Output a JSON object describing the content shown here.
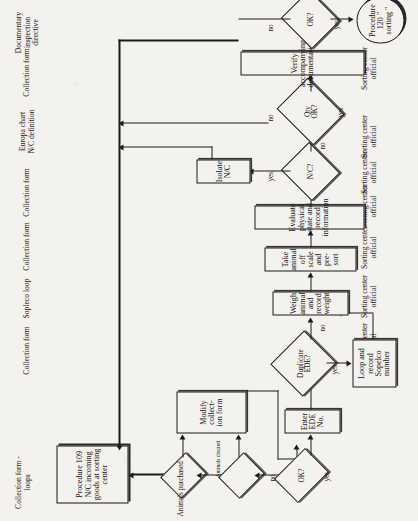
{
  "document": {
    "title": "Procedure 109 - N/C incoming goods at sorting center flowchart",
    "orientation": "rotated-90-ccw",
    "page_background": "#f4f2ee",
    "ink_color": "#141414"
  },
  "start_terminal": {
    "label": "Procedure 109\nN/C incoming\ngoods at sorting\ncenter"
  },
  "end_terminal": {
    "label": "Procedure 120 \" sorting \""
  },
  "process_nodes": [
    {
      "id": "modify-collection-form",
      "label": "Modify collect-\nion form"
    },
    {
      "id": "enter-ede-no",
      "label": "Enter EDE No."
    },
    {
      "id": "loop-record-sopelco",
      "label": "Loop and record\nSopelco number"
    },
    {
      "id": "weigh-animal",
      "label": "Weigh animal and record weight"
    },
    {
      "id": "take-animal-off-scale",
      "label": "Take animal off scale and pre-sort"
    },
    {
      "id": "evaluate-physical",
      "label": "Evaluate physical state and record information"
    },
    {
      "id": "isolate-nc",
      "label": "Isolate N/C"
    },
    {
      "id": "verify-documentation",
      "label": "Verify accompanying documentation"
    }
  ],
  "decision_nodes": [
    {
      "id": "dec-animals-purchased",
      "label": ""
    },
    {
      "id": "dec-animals-cleared",
      "label": ""
    },
    {
      "id": "dec-ok-1",
      "label": "OK?"
    },
    {
      "id": "dec-duplicate-ede",
      "label": "Duplicate\nEDE?"
    },
    {
      "id": "dec-nc",
      "label": "N/C?"
    },
    {
      "id": "dec-qty-ok",
      "label": "Qty\nOK?"
    },
    {
      "id": "dec-ok-2",
      "label": "OK?"
    }
  ],
  "edge_labels": [
    {
      "id": "edge-animals-purchased",
      "text": "Animals purchased"
    },
    {
      "id": "edge-animals-cleared",
      "text": "Animals cleared"
    },
    {
      "id": "edge-ok1-no",
      "text": "no"
    },
    {
      "id": "edge-ok1-yes",
      "text": "yes"
    },
    {
      "id": "edge-dup-yes",
      "text": "yes"
    },
    {
      "id": "edge-dup-no",
      "text": "no"
    },
    {
      "id": "edge-nc-yes",
      "text": "yes"
    },
    {
      "id": "edge-nc-no",
      "text": "no"
    },
    {
      "id": "edge-qty-no",
      "text": "no"
    },
    {
      "id": "edge-qty-yes",
      "text": "yes"
    },
    {
      "id": "edge-ok2-no",
      "text": "no"
    },
    {
      "id": "edge-ok2-yes",
      "text": "yes"
    }
  ],
  "document_labels": [
    {
      "id": "doc-collection-form-loops",
      "text": "Collection form -\nloops"
    },
    {
      "id": "doc-collection-form-1",
      "text": "Collection form"
    },
    {
      "id": "doc-sopleco-loop",
      "text": "Sopleco loop"
    },
    {
      "id": "doc-collection-form-2",
      "text": "Collection form"
    },
    {
      "id": "doc-collection-form-3",
      "text": "Collection form"
    },
    {
      "id": "doc-europa-chart",
      "text": "Europa chart\nN/C definition"
    },
    {
      "id": "doc-collection-form-4",
      "text": "Collection form"
    },
    {
      "id": "doc-inspection-directive",
      "text": "Documentary\ninspection\ndirective"
    }
  ],
  "role_labels": [
    {
      "id": "role-1",
      "text": "Sorting center\nofficial"
    },
    {
      "id": "role-2",
      "text": "Sorting center\nofficial"
    },
    {
      "id": "role-3",
      "text": "Sorting center\nofficial"
    },
    {
      "id": "role-4",
      "text": "Sorting center\nofficial"
    },
    {
      "id": "role-5",
      "text": "Sorting center\nofficial"
    },
    {
      "id": "role-6",
      "text": "Sorting center\nofficial"
    },
    {
      "id": "role-7",
      "text": "Sorting center\nofficial"
    }
  ]
}
